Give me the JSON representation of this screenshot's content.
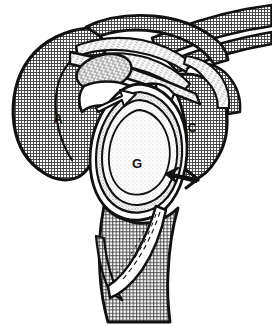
{
  "figure": {
    "kind": "anatomical-line-drawing",
    "width": 272,
    "height": 324,
    "background_color": "#ffffff",
    "ink_color": "#111111"
  },
  "labels": [
    {
      "id": "acromion",
      "text": "A",
      "x": 58,
      "y": 118,
      "font_size": 13
    },
    {
      "id": "glenoid",
      "text": "G",
      "x": 137,
      "y": 163,
      "font_size": 13
    },
    {
      "id": "coracoid-base",
      "text": "C",
      "x": 192,
      "y": 128,
      "font_size": 12
    }
  ],
  "annotations": [
    {
      "id": "white-arrow-superior-glenoid",
      "style": "white-outline-arrow",
      "points_to": "superior glenoid rim",
      "x": 120,
      "y": 96
    },
    {
      "id": "black-arrow-posterior-rim",
      "style": "solid-black-arrow",
      "points_to": "posterior glenoid rim",
      "x": 180,
      "y": 178
    }
  ],
  "regions": [
    {
      "id": "acromion-body",
      "fill": "crosshatch-dark",
      "label_ref": "acromion"
    },
    {
      "id": "scapular-spine-band",
      "fill": "crosshatch-dark"
    },
    {
      "id": "clavicle-band",
      "fill": "crosshatch-dark"
    },
    {
      "id": "coracoid-mass",
      "fill": "crosshatch-dark",
      "label_ref": "coracoid-base"
    },
    {
      "id": "glenoid-fossa",
      "fill": "light-stipple",
      "label_ref": "glenoid"
    },
    {
      "id": "glenoid-labrum-ring",
      "fill": "mid-stipple"
    },
    {
      "id": "humeral-shaft",
      "fill": "crosshatch-dark"
    },
    {
      "id": "coracoid-cut-face",
      "fill": "dash-hatch"
    },
    {
      "id": "ligament-fan-upper",
      "fill": "fiber-hatch"
    },
    {
      "id": "ligament-fan-lower",
      "fill": "fiber-hatch"
    },
    {
      "id": "capsule-white",
      "fill": "white"
    }
  ],
  "colors": {
    "ink": "#111111",
    "hatch_dark": "#4a4a4a",
    "stipple_light": "#e2e2e2",
    "stipple_mid": "#cfcfcf",
    "paper": "#ffffff"
  }
}
